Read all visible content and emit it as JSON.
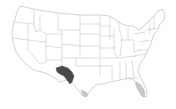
{
  "map": {
    "type": "choropleth",
    "region": "United States (contiguous)",
    "background": "#ffffff",
    "border_color": "#9a9a9a",
    "base_fill": "#ffffff",
    "highlights": [
      {
        "name": "west-texas-region",
        "fill": "#4a4a4a",
        "level": "dark"
      },
      {
        "name": "south-texas-tip",
        "fill": "#c8c8c8",
        "level": "light"
      },
      {
        "name": "south-florida",
        "fill": "#c8c8c8",
        "level": "light"
      }
    ]
  }
}
